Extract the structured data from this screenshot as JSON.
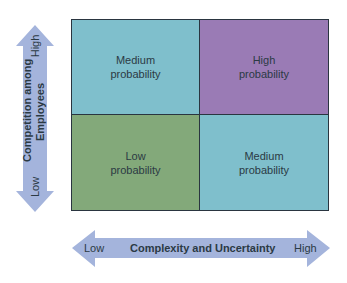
{
  "colors": {
    "medium": "#7fbfcc",
    "high": "#9a7bb5",
    "low": "#83a97a",
    "arrow": "#a4b4dc",
    "grid_line": "#2a3540",
    "text": "#2b3a44"
  },
  "grid": {
    "top_left": {
      "label": "Medium\nprobability"
    },
    "top_right": {
      "label": "High\nprobability"
    },
    "bottom_left": {
      "label": "Low\nprobability"
    },
    "bottom_right": {
      "label": "Medium\nprobability"
    }
  },
  "y_axis": {
    "title_line1": "Competition among",
    "title_line2": "Employees",
    "high_label": "High",
    "low_label": "Low"
  },
  "x_axis": {
    "title": "Complexity and Uncertainty",
    "low_label": "Low",
    "high_label": "High"
  }
}
